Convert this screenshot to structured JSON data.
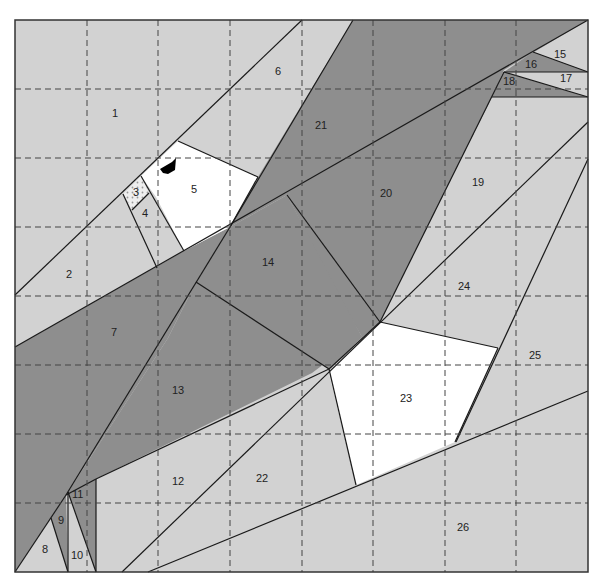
{
  "diagram": {
    "type": "paper-piecing quilt block pattern",
    "grid": {
      "columns": 8,
      "rows": 8,
      "style": "dashed"
    },
    "colors": {
      "light": "#d2d2d2",
      "dark": "#8e8e8e",
      "white": "#ffffff",
      "line": "#1a1a1a",
      "grid": "#444444"
    },
    "pieces": [
      {
        "id": "1",
        "label": "1",
        "shade": "light"
      },
      {
        "id": "2",
        "label": "2",
        "shade": "light"
      },
      {
        "id": "3",
        "label": "3",
        "shade": "dotted"
      },
      {
        "id": "4",
        "label": "4",
        "shade": "light"
      },
      {
        "id": "5",
        "label": "5",
        "shade": "white"
      },
      {
        "id": "6",
        "label": "6",
        "shade": "light"
      },
      {
        "id": "7",
        "label": "7",
        "shade": "dark"
      },
      {
        "id": "8",
        "label": "8",
        "shade": "light"
      },
      {
        "id": "9",
        "label": "9",
        "shade": "dark"
      },
      {
        "id": "10",
        "label": "10",
        "shade": "light"
      },
      {
        "id": "11",
        "label": "11",
        "shade": "dark"
      },
      {
        "id": "12",
        "label": "12",
        "shade": "light"
      },
      {
        "id": "13",
        "label": "13",
        "shade": "dark"
      },
      {
        "id": "14",
        "label": "14",
        "shade": "dark"
      },
      {
        "id": "15",
        "label": "15",
        "shade": "light"
      },
      {
        "id": "16",
        "label": "16",
        "shade": "dark"
      },
      {
        "id": "17",
        "label": "17",
        "shade": "light"
      },
      {
        "id": "18",
        "label": "18",
        "shade": "dark"
      },
      {
        "id": "19",
        "label": "19",
        "shade": "light"
      },
      {
        "id": "20",
        "label": "20",
        "shade": "dark"
      },
      {
        "id": "21",
        "label": "21",
        "shade": "dark"
      },
      {
        "id": "22",
        "label": "22",
        "shade": "light"
      },
      {
        "id": "23",
        "label": "23",
        "shade": "white"
      },
      {
        "id": "24",
        "label": "24",
        "shade": "light"
      },
      {
        "id": "25",
        "label": "25",
        "shade": "light"
      },
      {
        "id": "26",
        "label": "26",
        "shade": "light"
      }
    ]
  }
}
